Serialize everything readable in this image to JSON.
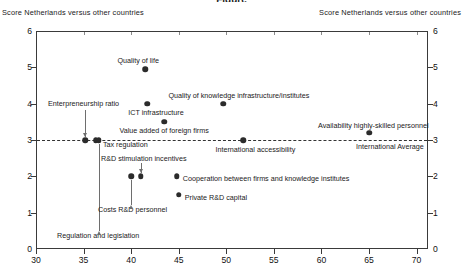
{
  "title": "Figure",
  "captions": {
    "left": "Score Netherlands versus other countries",
    "right": "Score Netherlands versus other countries"
  },
  "average_line": {
    "label": "International Average",
    "value": 3
  },
  "chart_data": {
    "type": "scatter",
    "title": "",
    "xlabel": "",
    "ylabel": "Score Netherlands versus other countries",
    "xlim": [
      30,
      71.2
    ],
    "ylim": [
      0,
      6
    ],
    "xticks": [
      30,
      35,
      40,
      45,
      50,
      55,
      60,
      65,
      70
    ],
    "yticks": [
      0,
      1,
      2,
      3,
      4,
      5,
      6
    ],
    "grid": false,
    "legend": "none",
    "annotations": [
      {
        "text": "International Average",
        "y": 3
      }
    ],
    "points": [
      {
        "label": "Quality of life",
        "x": 41.5,
        "y": 4.95
      },
      {
        "label": "Quality of knowledge infrastructure/institutes",
        "x": 49.7,
        "y": 4.0
      },
      {
        "label": "ICT infrastructure",
        "x": 41.7,
        "y": 4.0
      },
      {
        "label": "Value added of foreign firms",
        "x": 43.5,
        "y": 3.5
      },
      {
        "label": "Availability highly-skilled personnel",
        "x": 65.0,
        "y": 3.2
      },
      {
        "label": "Enterpreneurship ratio",
        "x": 35.2,
        "y": 3.0
      },
      {
        "label": "Tax regulation",
        "x": 36.3,
        "y": 3.0
      },
      {
        "label": "Regulation and legislation",
        "x": 36.6,
        "y": 3.0
      },
      {
        "label": "International accessibility",
        "x": 51.8,
        "y": 3.0
      },
      {
        "label": "Costs R&D personnel",
        "x": 40.0,
        "y": 2.0
      },
      {
        "label": "R&D stimulation incentives",
        "x": 41.0,
        "y": 2.0
      },
      {
        "label": "Cooperation between firms and knowledge institutes",
        "x": 44.8,
        "y": 2.0
      },
      {
        "label": "Private R&D capital",
        "x": 45.0,
        "y": 1.5
      }
    ]
  },
  "labels": {
    "quality_of_life": "Quality of life",
    "quality_knowledge": "Quality of knowledge infrastructure/institutes",
    "ict": "ICT infrastructure",
    "value_added": "Value added of foreign firms",
    "availability": "Availability highly-skilled personnel",
    "entrepreneurship": "Enterpreneurship ratio",
    "tax_regulation": "Tax regulation",
    "regulation_legislation": "Regulation and legislation",
    "intl_accessibility": "International accessibility",
    "costs_rd": "Costs R&D personnel",
    "rd_stimulation": "R&D stimulation incentives",
    "cooperation": "Cooperation between firms and knowledge institutes",
    "private_rd": "Private R&D capital"
  },
  "axis": {
    "y_ticks": [
      "0",
      "1",
      "2",
      "3",
      "4",
      "5",
      "6"
    ],
    "x_ticks": [
      "30",
      "35",
      "40",
      "45",
      "50",
      "55",
      "60",
      "65",
      "70"
    ]
  }
}
